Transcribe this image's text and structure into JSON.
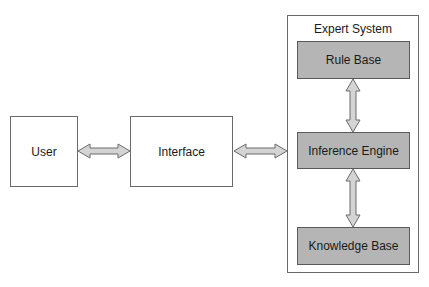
{
  "colors": {
    "border": "#6a6a6a",
    "inner_fill": "#b5b5b5",
    "arrow_fill": "#d4d4d4",
    "arrow_stroke": "#6a6a6a",
    "text": "#1a1a1a"
  },
  "nodes": {
    "user": {
      "label": "User"
    },
    "interface": {
      "label": "Interface"
    },
    "expert_system": {
      "title": "Expert System",
      "components": {
        "rule_base": {
          "label": "Rule Base"
        },
        "inference_engine": {
          "label": "Inference Engine"
        },
        "knowledge_base": {
          "label": "Knowledge Base"
        }
      }
    }
  },
  "edges": [
    {
      "from": "User",
      "to": "Interface",
      "type": "bidirectional-arrow"
    },
    {
      "from": "Interface",
      "to": "Inference Engine",
      "type": "bidirectional-arrow"
    },
    {
      "from": "Rule Base",
      "to": "Inference Engine",
      "type": "bidirectional-arrow"
    },
    {
      "from": "Inference Engine",
      "to": "Knowledge Base",
      "type": "bidirectional-arrow"
    }
  ]
}
